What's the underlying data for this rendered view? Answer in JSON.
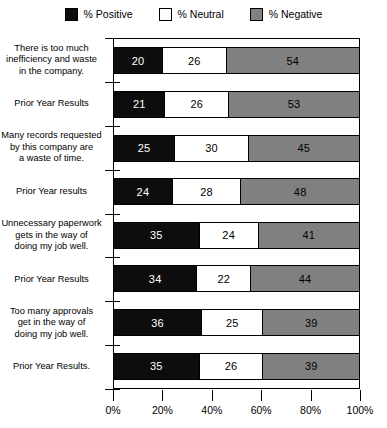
{
  "legend": {
    "items": [
      {
        "label": "% Positive",
        "swatch": "black-square-icon",
        "color": "#0d0d0d"
      },
      {
        "label": "% Neutral",
        "swatch": "white-square-icon",
        "color": "#ffffff"
      },
      {
        "label": "% Negative",
        "swatch": "gray-square-icon",
        "color": "#808080"
      }
    ]
  },
  "chart_data": {
    "type": "bar",
    "orientation": "horizontal",
    "stacked": true,
    "title": "",
    "subtitle": "",
    "xlabel": "",
    "ylabel": "",
    "xlim": [
      0,
      100
    ],
    "xticks": [
      0,
      20,
      40,
      60,
      80,
      100
    ],
    "xticklabels": [
      "0%",
      "20%",
      "40%",
      "60%",
      "80%",
      "100%"
    ],
    "grid": false,
    "legend_position": "top-center",
    "categories": [
      "There is too much inefficiency and waste in the company.",
      "Prior Year Results",
      "Many records requested by this company are a waste of time.",
      "Prior Year results",
      "Unnecessary paperwork gets in the way of doing my job well.",
      "Prior Year Results",
      "Too many approvals get in the way of doing my job well.",
      "Prior Year Results."
    ],
    "category_lines": [
      [
        "There is too much",
        "inefficiency and waste",
        "in the company."
      ],
      [
        "Prior Year Results"
      ],
      [
        "Many records requested",
        "by this company are",
        "a waste of time."
      ],
      [
        "Prior Year results"
      ],
      [
        "Unnecessary paperwork",
        "gets in the way of",
        "doing my job well."
      ],
      [
        "Prior Year Results"
      ],
      [
        "Too many approvals",
        "get in the way of",
        "doing my job well."
      ],
      [
        "Prior Year Results."
      ]
    ],
    "series": [
      {
        "name": "% Positive",
        "color": "#0d0d0d",
        "values": [
          20,
          21,
          25,
          24,
          35,
          34,
          36,
          35
        ]
      },
      {
        "name": "% Neutral",
        "color": "#ffffff",
        "values": [
          26,
          26,
          30,
          28,
          24,
          22,
          25,
          26
        ]
      },
      {
        "name": "% Negative",
        "color": "#808080",
        "values": [
          54,
          53,
          45,
          48,
          41,
          44,
          39,
          39
        ]
      }
    ],
    "bars": [
      {
        "category": "There is too much inefficiency and waste in the company.",
        "positive": 20,
        "neutral": 26,
        "negative": 54
      },
      {
        "category": "Prior Year Results",
        "positive": 21,
        "neutral": 26,
        "negative": 53
      },
      {
        "category": "Many records requested by this company are a waste of time.",
        "positive": 25,
        "neutral": 30,
        "negative": 45
      },
      {
        "category": "Prior Year results",
        "positive": 24,
        "neutral": 28,
        "negative": 48
      },
      {
        "category": "Unnecessary paperwork gets in the way of doing my job well.",
        "positive": 35,
        "neutral": 24,
        "negative": 41
      },
      {
        "category": "Prior Year Results",
        "positive": 34,
        "neutral": 22,
        "negative": 44
      },
      {
        "category": "Too many approvals get in the way of doing my job well.",
        "positive": 36,
        "neutral": 25,
        "negative": 39
      },
      {
        "category": "Prior Year Results.",
        "positive": 35,
        "neutral": 26,
        "negative": 39
      }
    ]
  }
}
